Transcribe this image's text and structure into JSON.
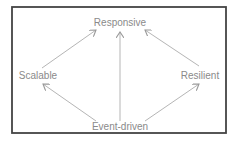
{
  "diagram": {
    "type": "directed-graph",
    "frame": {
      "x": 12,
      "y": 7,
      "width": 214,
      "height": 126,
      "stroke": "#444444"
    },
    "colors": {
      "text": "#8a8a8a",
      "arrow": "#b5b5b5",
      "frame": "#444444"
    },
    "nodes": [
      {
        "id": "responsive",
        "label": "Responsive",
        "x": 120,
        "y": 26
      },
      {
        "id": "scalable",
        "label": "Scalable",
        "x": 38,
        "y": 79
      },
      {
        "id": "resilient",
        "label": "Resilient",
        "x": 200,
        "y": 79
      },
      {
        "id": "event-driven",
        "label": "Event-driven",
        "x": 120,
        "y": 132
      }
    ],
    "edges": [
      {
        "from": "scalable",
        "to": "responsive"
      },
      {
        "from": "event-driven",
        "to": "responsive"
      },
      {
        "from": "resilient",
        "to": "responsive"
      },
      {
        "from": "event-driven",
        "to": "scalable"
      },
      {
        "from": "event-driven",
        "to": "resilient"
      }
    ]
  }
}
